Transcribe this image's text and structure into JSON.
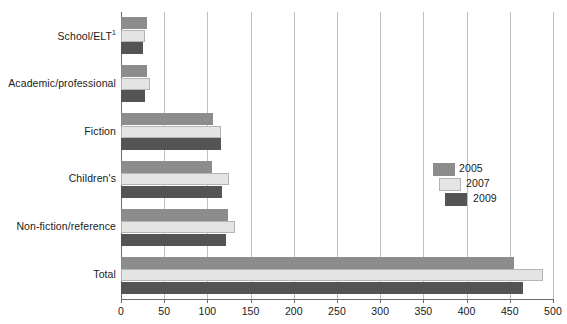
{
  "chart_data": {
    "type": "bar",
    "orientation": "horizontal",
    "title": "",
    "xlabel": "",
    "ylabel": "",
    "xlim": [
      0,
      500
    ],
    "xticks": [
      0,
      50,
      100,
      150,
      200,
      250,
      300,
      350,
      400,
      450,
      500
    ],
    "xtick_labels": [
      "0",
      "50",
      "100",
      "150",
      "200",
      "250",
      "300",
      "350",
      "400",
      "450",
      "500"
    ],
    "grid": true,
    "grid_axis": "x",
    "legend_position": "center-right",
    "categories": [
      "School/ELT",
      "Academic/professional",
      "Fiction",
      "Children's",
      "Non-fiction/reference",
      "Total"
    ],
    "category_labels": [
      {
        "text": "School/ELT",
        "superscript": "1"
      },
      {
        "text": "Academic/professional",
        "superscript": ""
      },
      {
        "text": "Fiction",
        "superscript": ""
      },
      {
        "text": "Children's",
        "superscript": ""
      },
      {
        "text": "Non-fiction/reference",
        "superscript": ""
      },
      {
        "text": "Total",
        "superscript": ""
      }
    ],
    "series": [
      {
        "name": "2005",
        "color": "#8c8c8c",
        "values": [
          30,
          30,
          107,
          105,
          124,
          455
        ]
      },
      {
        "name": "2007",
        "color": "#e4e4e4",
        "values": [
          28,
          33,
          116,
          125,
          132,
          489
        ]
      },
      {
        "name": "2009",
        "color": "#545454",
        "values": [
          25,
          28,
          116,
          117,
          121,
          465
        ]
      }
    ]
  },
  "legend": {
    "entries": [
      {
        "label": "2005",
        "color": "#8c8c8c"
      },
      {
        "label": "2007",
        "color": "#e4e4e4"
      },
      {
        "label": "2009",
        "color": "#545454"
      }
    ]
  }
}
